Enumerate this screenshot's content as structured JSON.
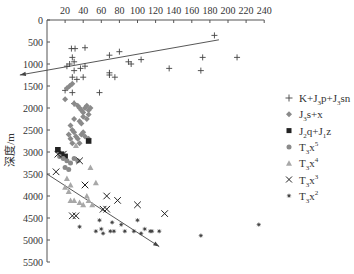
{
  "chart_data": {
    "type": "scatter",
    "title": "",
    "xlabel": "",
    "ylabel": "深度/m",
    "x_axis_position": "top",
    "y_axis_inverted": true,
    "xlim": [
      0,
      240
    ],
    "ylim": [
      0,
      5500
    ],
    "x_ticks": [
      20,
      40,
      60,
      80,
      100,
      120,
      140,
      160,
      180,
      200,
      220,
      240
    ],
    "y_ticks": [
      0,
      500,
      1000,
      1500,
      2000,
      2500,
      3000,
      3500,
      4000,
      4500,
      5000,
      5500
    ],
    "grid": false,
    "legend_position": "right",
    "colors": {
      "axis": "#555555",
      "dark": "#333333",
      "gray": "#8a8a8a",
      "light_gray": "#a8a8a8"
    },
    "series": [
      {
        "name": "K+J3p+J3sn",
        "label_parts": [
          "K+J",
          "3",
          "p+J",
          "3",
          "sn"
        ],
        "marker": "plus",
        "color": "#444444",
        "points": [
          [
            27,
            650
          ],
          [
            31,
            650
          ],
          [
            42,
            630
          ],
          [
            69,
            800
          ],
          [
            80,
            720
          ],
          [
            185,
            350
          ],
          [
            172,
            850
          ],
          [
            210,
            850
          ],
          [
            28,
            850
          ],
          [
            30,
            950
          ],
          [
            22,
            1050
          ],
          [
            25,
            1000
          ],
          [
            30,
            1150
          ],
          [
            42,
            1050
          ],
          [
            28,
            1300
          ],
          [
            37,
            1100
          ],
          [
            75,
            1300
          ],
          [
            69,
            1250
          ],
          [
            69,
            1200
          ],
          [
            93,
            1000
          ],
          [
            40,
            1300
          ],
          [
            33,
            1350
          ],
          [
            58,
            1650
          ],
          [
            28,
            1650
          ],
          [
            20,
            1600
          ],
          [
            30,
            1900
          ],
          [
            90,
            950
          ],
          [
            104,
            900
          ],
          [
            135,
            1100
          ],
          [
            170,
            1150
          ]
        ]
      },
      {
        "name": "J3s+x",
        "label_parts": [
          "J",
          "3",
          "s+x"
        ],
        "marker": "diamond",
        "color": "#8a8a8a",
        "points": [
          [
            22,
            1550
          ],
          [
            25,
            1500
          ],
          [
            28,
            1450
          ],
          [
            20,
            1800
          ],
          [
            30,
            1900
          ],
          [
            34,
            1950
          ],
          [
            36,
            2000
          ],
          [
            38,
            2050
          ],
          [
            40,
            2100
          ],
          [
            42,
            2000
          ],
          [
            44,
            1950
          ],
          [
            46,
            2050
          ],
          [
            48,
            2000
          ],
          [
            40,
            2200
          ],
          [
            44,
            2250
          ],
          [
            46,
            2150
          ],
          [
            36,
            2300
          ],
          [
            38,
            2350
          ],
          [
            30,
            2250
          ],
          [
            26,
            2400
          ],
          [
            28,
            2500
          ],
          [
            24,
            2600
          ],
          [
            30,
            2550
          ],
          [
            32,
            2650
          ],
          [
            34,
            2700
          ],
          [
            38,
            2600
          ],
          [
            40,
            2550
          ],
          [
            42,
            2650
          ],
          [
            46,
            2700
          ],
          [
            36,
            2800
          ],
          [
            28,
            2800
          ],
          [
            26,
            2700
          ]
        ]
      },
      {
        "name": "J2q+J1z",
        "label_parts": [
          "J",
          "2",
          "q+J",
          "1",
          "z"
        ],
        "marker": "square",
        "color": "#222222",
        "points": [
          [
            46,
            2750
          ],
          [
            12,
            2950
          ],
          [
            16,
            3050
          ],
          [
            20,
            3100
          ]
        ]
      },
      {
        "name": "T3x5",
        "label_parts": [
          "T",
          "3",
          "x",
          "5"
        ],
        "marker": "circle",
        "color": "#8a8a8a",
        "points": [
          [
            14,
            3100
          ],
          [
            18,
            3150
          ],
          [
            22,
            3200
          ],
          [
            26,
            3250
          ],
          [
            30,
            3150
          ],
          [
            34,
            3200
          ],
          [
            20,
            3350
          ],
          [
            24,
            3400
          ]
        ]
      },
      {
        "name": "T3x4",
        "label_parts": [
          "T",
          "3",
          "x",
          "4"
        ],
        "marker": "triangle",
        "color": "#a8a8a8",
        "points": [
          [
            32,
            2850
          ],
          [
            48,
            3350
          ],
          [
            22,
            3600
          ],
          [
            20,
            3800
          ],
          [
            24,
            3900
          ],
          [
            26,
            3750
          ],
          [
            30,
            4100
          ],
          [
            36,
            4150
          ],
          [
            40,
            4200
          ],
          [
            46,
            4100
          ],
          [
            50,
            4200
          ],
          [
            54,
            3700
          ],
          [
            44,
            4000
          ],
          [
            26,
            4100
          ]
        ]
      },
      {
        "name": "T3x3",
        "label_parts": [
          "T",
          "3",
          "x",
          "3"
        ],
        "marker": "x",
        "color": "#222222",
        "points": [
          [
            12,
            3050
          ],
          [
            18,
            3050
          ],
          [
            36,
            3200
          ],
          [
            10,
            3450
          ],
          [
            42,
            3750
          ],
          [
            66,
            4000
          ],
          [
            66,
            4300
          ],
          [
            62,
            4300
          ],
          [
            78,
            4100
          ],
          [
            28,
            4450
          ],
          [
            32,
            4450
          ],
          [
            130,
            4400
          ],
          [
            100,
            4200
          ]
        ]
      },
      {
        "name": "T3x2",
        "label_parts": [
          "T",
          "3",
          "x",
          "2"
        ],
        "marker": "asterisk",
        "color": "#444444",
        "points": [
          [
            36,
            4700
          ],
          [
            58,
            4550
          ],
          [
            54,
            4800
          ],
          [
            60,
            4750
          ],
          [
            62,
            4850
          ],
          [
            70,
            4800
          ],
          [
            74,
            4800
          ],
          [
            82,
            4650
          ],
          [
            100,
            4550
          ],
          [
            96,
            4800
          ],
          [
            108,
            4750
          ],
          [
            114,
            4800
          ],
          [
            116,
            4800
          ],
          [
            124,
            4800
          ],
          [
            170,
            4900
          ],
          [
            234,
            4650
          ],
          [
            72,
            4600
          ],
          [
            86,
            4800
          ],
          [
            104,
            4850
          ]
        ]
      }
    ],
    "trend_lines": [
      {
        "name": "upper-trend",
        "from": [
          190,
          450
        ],
        "to": [
          -30,
          1250
        ],
        "arrow_at": "to"
      },
      {
        "name": "lower-trend",
        "from": [
          0,
          3500
        ],
        "to": [
          124,
          5150
        ],
        "arrow_at": "to"
      }
    ]
  }
}
